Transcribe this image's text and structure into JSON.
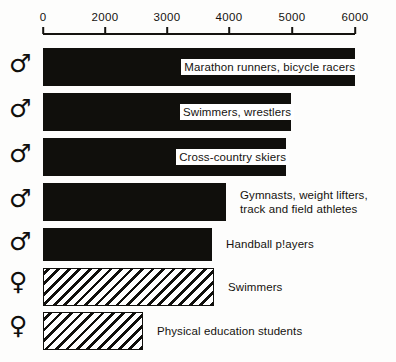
{
  "chart_data": {
    "type": "bar",
    "orientation": "horizontal",
    "title": "",
    "subtitle": "",
    "xlabel": "",
    "ylabel": "",
    "grid": false,
    "legend": null,
    "axis": {
      "tick_labels": [
        "0",
        "2000",
        "3000",
        "4000",
        "5000",
        "6000"
      ],
      "tick_values": [
        0,
        2000,
        3000,
        4000,
        5000,
        6000
      ],
      "tick_positions_px": [
        43,
        105,
        167,
        229,
        292,
        355
      ],
      "note": "Axis ticks are evenly spaced although the value gap 0-2000 is larger than the others (broken/compressed scale).",
      "xlim": [
        0,
        6000
      ]
    },
    "categories": [
      "Marathon runners, bicycle racers",
      "Swimmers, wrestlers",
      "Cross-country skiers",
      "Gymnasts, weight lifters,\ntrack and field athletes",
      "Handball p!ayers",
      "Swimmers",
      "Physical education students"
    ],
    "values": [
      6000,
      5000,
      4900,
      4000,
      3700,
      3750,
      3200
    ],
    "bars": [
      {
        "label": "Marathon runners, bicycle racers",
        "sex": "male",
        "sex_symbol": "♂",
        "symbol_name": "mars-symbol",
        "value": 6000,
        "fill": "solid",
        "label_placement": "inline",
        "bar_end_px": 355,
        "color": "#100f0c"
      },
      {
        "label": "Swimmers, wrestlers",
        "sex": "male",
        "sex_symbol": "♂",
        "symbol_name": "mars-symbol",
        "value": 5000,
        "fill": "solid",
        "label_placement": "inline",
        "bar_end_px": 291,
        "color": "#100f0c"
      },
      {
        "label": "Cross-country skiers",
        "sex": "male",
        "sex_symbol": "♂",
        "symbol_name": "mars-symbol",
        "value": 4900,
        "fill": "solid",
        "label_placement": "inline",
        "bar_end_px": 286,
        "color": "#100f0c"
      },
      {
        "label": "Gymnasts, weight lifters,\ntrack and field athletes",
        "sex": "male",
        "sex_symbol": "♂",
        "symbol_name": "mars-symbol",
        "value": 4000,
        "fill": "solid",
        "label_placement": "right",
        "bar_end_px": 226,
        "color": "#100f0c"
      },
      {
        "label": "Handball p!ayers",
        "sex": "male",
        "sex_symbol": "♂",
        "symbol_name": "mars-symbol",
        "value": 3700,
        "fill": "solid",
        "label_placement": "right",
        "bar_end_px": 212,
        "color": "#100f0c"
      },
      {
        "label": "Swimmers",
        "sex": "female",
        "sex_symbol": "♀",
        "symbol_name": "venus-symbol",
        "value": 3750,
        "fill": "hatched",
        "label_placement": "right",
        "bar_end_px": 214,
        "color": "#100f0c"
      },
      {
        "label": "Physical education students",
        "sex": "female",
        "sex_symbol": "♀",
        "symbol_name": "venus-symbol",
        "value": 3200,
        "fill": "hatched",
        "label_placement": "right",
        "bar_end_px": 143,
        "color": "#100f0c"
      }
    ],
    "colors": {
      "bar_solid": "#100f0c",
      "bar_hatch_line": "#100f0c",
      "bar_hatch_ground": "#ffffff",
      "axis": "#15130f",
      "text": "#15130f",
      "background": "#fdfdfc"
    }
  }
}
